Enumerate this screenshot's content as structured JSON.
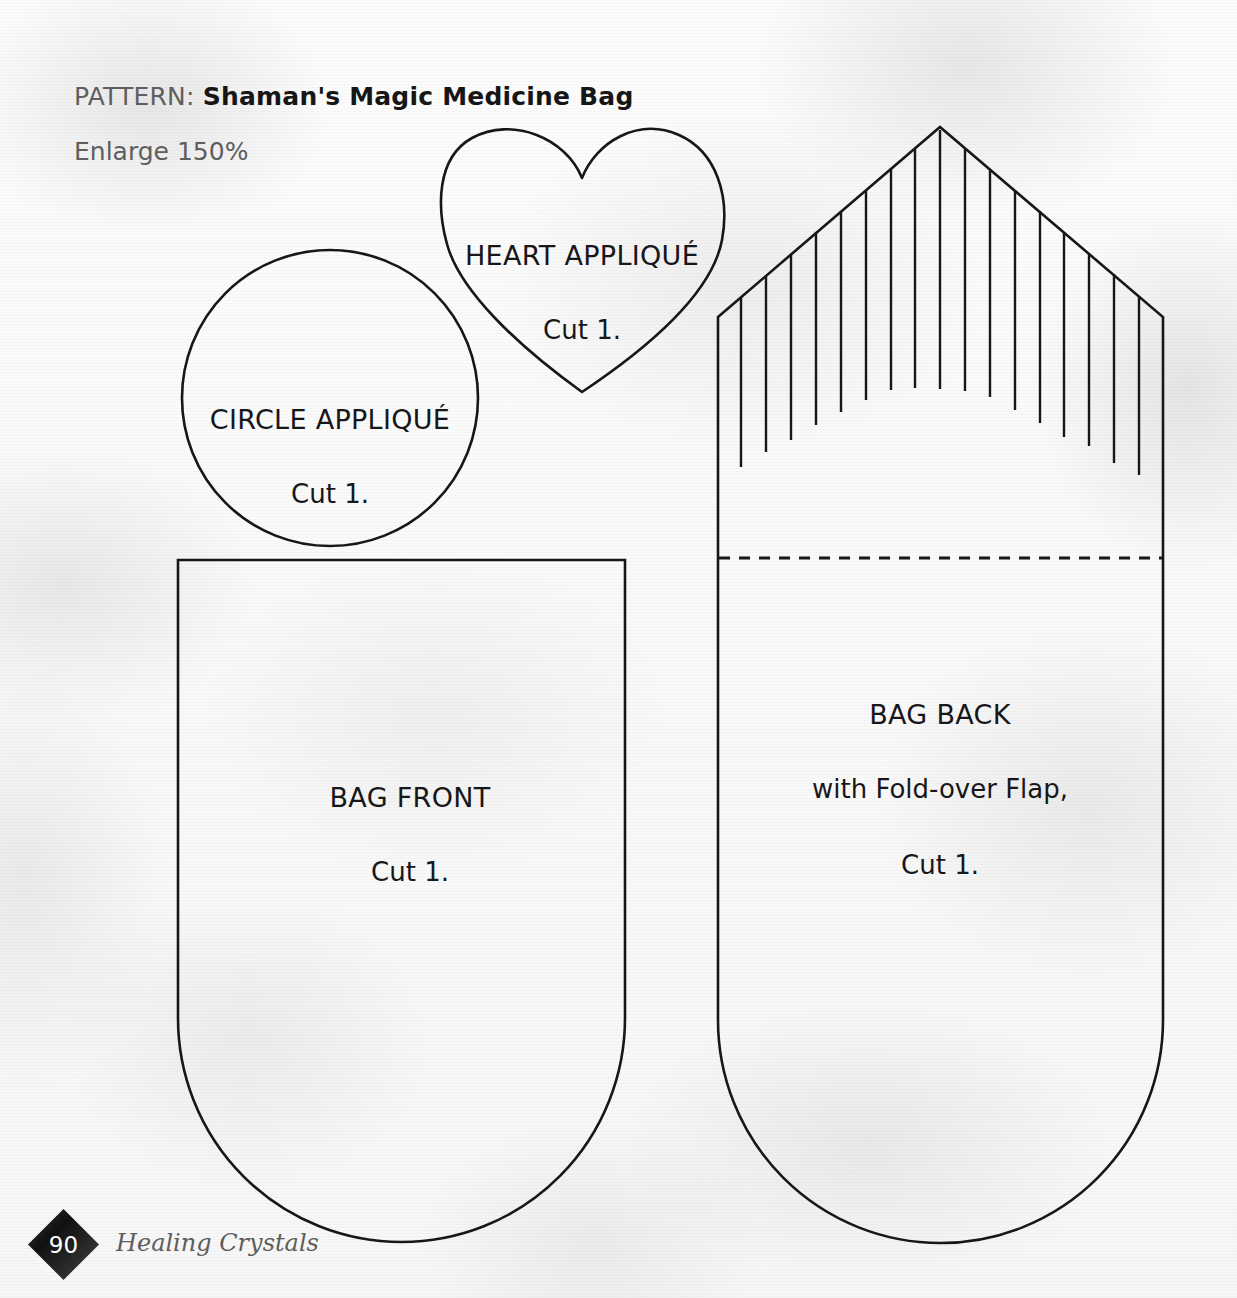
{
  "page": {
    "width": 1237,
    "height": 1298,
    "background_color": "#fafafa",
    "ink_color": "#1b1b1b",
    "muted_text_color": "#5e5e5e"
  },
  "header": {
    "pattern_label": "PATTERN:",
    "pattern_name": "Shaman's Magic Medicine Bag",
    "enlarge_note": "Enlarge 150%"
  },
  "pieces": [
    {
      "id": "circle-applique",
      "name": "CIRCLE APPLIQUÉ",
      "cut": "Cut 1.",
      "shape": "circle",
      "cx": 330,
      "cy": 398,
      "r": 148
    },
    {
      "id": "heart-applique",
      "name": "HEART APPLIQUÉ",
      "cut": "Cut 1.",
      "shape": "heart",
      "left": 441,
      "right": 723,
      "top": 130,
      "bottom": 392,
      "tip_x": 582
    },
    {
      "id": "bag-front",
      "name": "BAG FRONT",
      "cut": "Cut 1.",
      "shape": "rounded-bottom-rectangle",
      "left": 178,
      "right": 625,
      "top": 560,
      "bottom": 1242
    },
    {
      "id": "bag-back",
      "name": "BAG BACK",
      "subtitle": "with Fold-over Flap,",
      "cut": "Cut 1.",
      "shape": "rounded-bottom-rectangle-with-pointed-flap",
      "left": 718,
      "right": 1163,
      "bottom": 1243,
      "flap_apex_x": 940,
      "flap_apex_y": 127,
      "flap_shoulder_y": 317,
      "fold_line_y": 558,
      "fold_line_style": "dashed",
      "fringe_count": 17,
      "fringe_spacing": 25
    }
  ],
  "footer": {
    "page_number": "90",
    "book_title": "Healing Crystals",
    "diamond_color": "#1a1a1a"
  }
}
